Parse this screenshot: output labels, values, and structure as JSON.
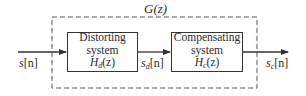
{
  "diagram": {
    "group_label": "G(z)",
    "input_signal": {
      "base": "s",
      "index": "[n]",
      "sub": ""
    },
    "blocks": [
      {
        "line1": "Distorting",
        "line2": "system",
        "tf_base": "H",
        "tf_sub": "d",
        "tf_arg": "(z)"
      },
      {
        "line1": "Compensating",
        "line2": "system",
        "tf_base": "H",
        "tf_sub": "c",
        "tf_arg": "(z)"
      }
    ],
    "intermediate_signal": {
      "base": "s",
      "sub": "d",
      "index": "[n]"
    },
    "output_signal": {
      "base": "s",
      "sub": "c",
      "index": "[n]"
    },
    "colors": {
      "line": "#333333",
      "dashed": "#555555",
      "text": "#2a2a2a"
    }
  }
}
